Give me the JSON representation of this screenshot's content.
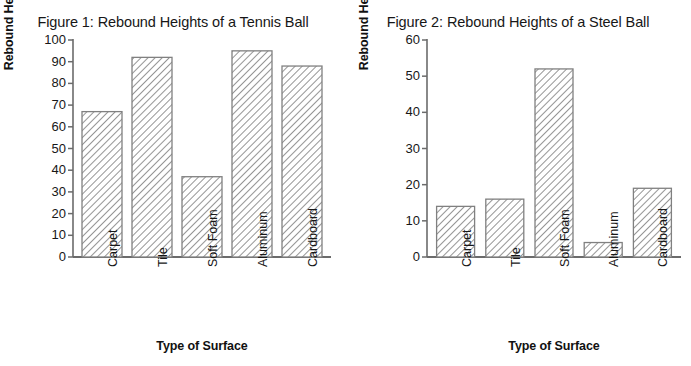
{
  "figures": [
    {
      "id": "figure-1",
      "title": "Figure 1: Rebound Heights of a Tennis Ball",
      "ylabel": "Rebound Height (cm)",
      "xlabel": "Type of Surface"
    },
    {
      "id": "figure-2",
      "title": "Figure 2: Rebound Heights of a Steel Ball",
      "ylabel": "Rebound Height (cm)",
      "xlabel": "Type of Surface"
    }
  ],
  "chart_data": [
    {
      "type": "bar",
      "title": "Figure 1: Rebound Heights of a Tennis Ball",
      "xlabel": "Type of Surface",
      "ylabel": "Rebound Height (cm)",
      "categories": [
        "Carpet",
        "Tile",
        "Soft Foam",
        "Aluminum",
        "Cardboard"
      ],
      "values": [
        67,
        92,
        37,
        95,
        88
      ],
      "ylim": [
        0,
        100
      ],
      "yticks": [
        0,
        10,
        20,
        30,
        40,
        50,
        60,
        70,
        80,
        90,
        100
      ],
      "ytick_labels": [
        "0",
        "10",
        "20",
        "30",
        "40",
        "50",
        "60",
        "70",
        "80",
        "90",
        "100"
      ],
      "grid": false,
      "legend": "none",
      "bar_fill": "diagonal-hatch",
      "bar_edge_color": "#808080",
      "hatch_color": "#4d4d4d"
    },
    {
      "type": "bar",
      "title": "Figure 2: Rebound Heights of a Steel Ball",
      "xlabel": "Type of Surface",
      "ylabel": "Rebound Height (cm)",
      "categories": [
        "Carpet",
        "Tile",
        "Soft Foam",
        "Aluminum",
        "Cardboard"
      ],
      "values": [
        14,
        16,
        52,
        4,
        19
      ],
      "ylim": [
        0,
        60
      ],
      "yticks": [
        0,
        10,
        20,
        30,
        40,
        50,
        60
      ],
      "ytick_labels": [
        "0",
        "10",
        "20",
        "30",
        "40",
        "50",
        "60"
      ],
      "grid": false,
      "legend": "none",
      "bar_fill": "diagonal-hatch",
      "bar_edge_color": "#808080",
      "hatch_color": "#4d4d4d"
    }
  ]
}
